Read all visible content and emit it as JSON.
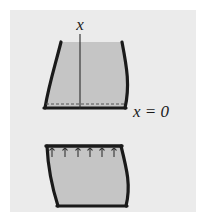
{
  "figure": {
    "canvas": {
      "width": 207,
      "height": 219,
      "outer_background": "#ffffff"
    },
    "panel": {
      "name": "figure-panel",
      "x": 10,
      "y": 10,
      "width": 186,
      "height": 202,
      "fill": "#ebebeb"
    },
    "colors": {
      "outer_background": "#ffffff",
      "panel_background": "#ebebeb",
      "shape_fill": "#c5c5c5",
      "outline": "#1a1a1a",
      "axis_line": "#2a2a2a",
      "dashed_line": "#555555",
      "tick_mark": "#333333",
      "label_text": "#1a1a1a"
    },
    "labels": {
      "axis_label": "x",
      "datum_label": "x = 0"
    },
    "upper_shape": {
      "name": "upper-curvilinear-element",
      "description": "Curvilinear quadrilateral, flat top and bottom, both side edges bow leftward",
      "path": "M 61 42 L 122 42 C 126 66 130 88 125 108 L 45 108 C 47 88 54 64 61 42 Z",
      "outline_width": 3.2,
      "has_top_outline": false
    },
    "upper_axis": {
      "name": "x-axis-line",
      "x": 80,
      "y_top": 34,
      "y_bottom": 109,
      "stroke_width": 1.1
    },
    "upper_dashed_line": {
      "name": "datum-dashed-line",
      "x_start": 46,
      "x_end": 124,
      "y": 104,
      "stroke_width": 1,
      "dash_pattern": "3 2"
    },
    "lower_shape": {
      "name": "lower-curvilinear-element",
      "description": "Curvilinear quadrilateral with flat thick top edge carrying distributed traction arrows",
      "path": "M 47 146 L 121 146 C 125 168 130 190 126 206 L 58 206 C 52 188 48 166 47 146 Z",
      "outline_width": 3.2,
      "has_top_outline": true
    },
    "traction_arrows": {
      "name": "traction-arrow-set",
      "count": 6,
      "y_base": 157,
      "y_tip": 148,
      "x_positions": [
        52,
        65,
        78,
        90,
        102,
        114
      ],
      "stroke_width": 1.1,
      "head_size": 2.2
    },
    "label_positions": {
      "axis_label": {
        "x": 80,
        "y": 30,
        "font_size": 17
      },
      "datum_label": {
        "x": 133,
        "y": 117,
        "font_size": 17
      }
    }
  }
}
